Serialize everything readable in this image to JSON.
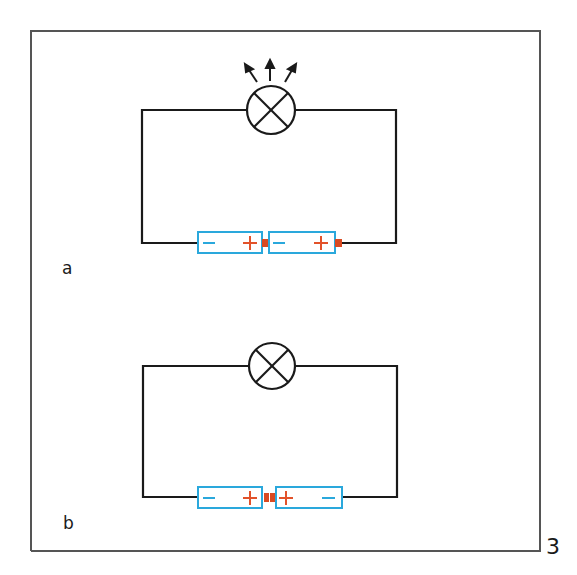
{
  "figure": {
    "number": "3",
    "colors": {
      "wire": "#1a1a1a",
      "frame": "#555555",
      "battery_outline": "#2aa8dc",
      "minus_sign": "#2aa8dc",
      "plus_sign": "#e2522a",
      "terminal": "#d94a22"
    }
  },
  "circuits": [
    {
      "label": "a",
      "lamp_state": "lit",
      "battery_arrangement": "series-aligned",
      "batteries": [
        {
          "left_sign": "−",
          "right_sign": "+"
        },
        {
          "left_sign": "−",
          "right_sign": "+"
        }
      ]
    },
    {
      "label": "b",
      "lamp_state": "unlit",
      "battery_arrangement": "opposed (+ to +)",
      "batteries": [
        {
          "left_sign": "−",
          "right_sign": "+"
        },
        {
          "left_sign": "+",
          "right_sign": "−"
        }
      ]
    }
  ]
}
